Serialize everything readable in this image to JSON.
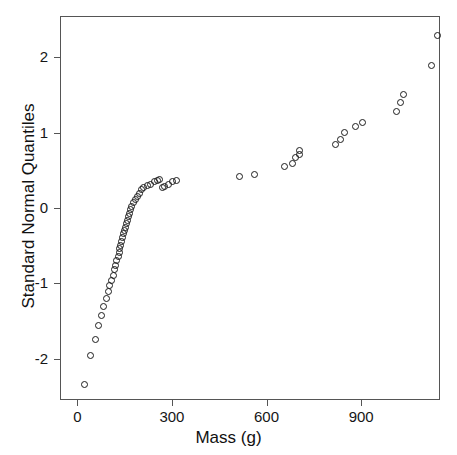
{
  "scan_artifact_text": "........................................",
  "chart_data": {
    "type": "scatter",
    "title": "",
    "xlabel": "Mass (g)",
    "ylabel": "Standard Normal Quantiles",
    "xlim": [
      -55,
      1150
    ],
    "ylim": [
      -2.55,
      2.55
    ],
    "xticks": [
      0,
      300,
      600,
      900
    ],
    "xtick_labels": [
      "0",
      "300",
      "600",
      "900"
    ],
    "yticks": [
      -2,
      -1,
      0,
      1,
      2
    ],
    "ytick_labels": [
      "-2",
      "-1",
      "0",
      "1",
      "2"
    ],
    "grid": false,
    "legend": null,
    "marker": "open-circle",
    "marker_color": "#1c1c1c",
    "n_points": 60,
    "x": [
      18,
      38,
      55,
      63,
      72,
      80,
      88,
      95,
      100,
      105,
      110,
      114,
      118,
      122,
      126,
      129,
      132,
      135,
      138,
      141,
      144,
      147,
      150,
      153,
      156,
      159,
      162,
      166,
      170,
      175,
      180,
      186,
      193,
      200,
      208,
      218,
      228,
      240,
      252,
      258,
      266,
      272,
      286,
      300,
      310,
      510,
      560,
      655,
      680,
      690,
      700,
      700,
      815,
      830,
      845,
      880,
      900,
      1010,
      1020,
      1030,
      1120,
      1140
    ],
    "y": [
      -2.33,
      -1.95,
      -1.73,
      -1.55,
      -1.42,
      -1.3,
      -1.19,
      -1.1,
      -1.02,
      -0.95,
      -0.88,
      -0.81,
      -0.75,
      -0.69,
      -0.63,
      -0.58,
      -0.53,
      -0.48,
      -0.43,
      -0.38,
      -0.33,
      -0.28,
      -0.24,
      -0.19,
      -0.15,
      -0.1,
      -0.06,
      -0.01,
      0.03,
      0.08,
      0.12,
      0.17,
      0.21,
      0.26,
      0.28,
      0.31,
      0.33,
      0.36,
      0.38,
      0.39,
      0.28,
      0.3,
      0.33,
      0.36,
      0.38,
      0.43,
      0.46,
      0.56,
      0.6,
      0.68,
      0.72,
      0.78,
      0.86,
      0.92,
      1.02,
      1.1,
      1.15,
      1.3,
      1.42,
      1.52,
      1.9,
      2.3
    ]
  }
}
